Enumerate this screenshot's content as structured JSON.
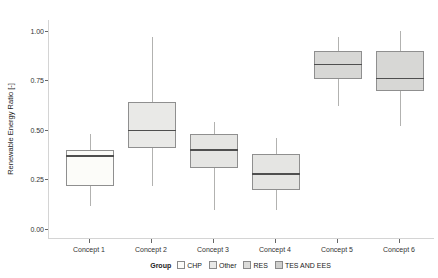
{
  "figure": {
    "background": "#ffffff"
  },
  "chart_data": {
    "type": "boxplot",
    "title": "",
    "xlabel": "",
    "ylabel": "Renewable Energy Ratio [-]",
    "ylim": [
      0,
      1.0
    ],
    "grid": "off",
    "yticks": [
      "0.00",
      "0.25",
      "0.50",
      "0.75",
      "1.00"
    ],
    "ytick_values": [
      0,
      0.25,
      0.5,
      0.75,
      1.0
    ],
    "categories": [
      "Concept 1",
      "Concept 2",
      "Concept 3",
      "Concept 4",
      "Concept 5",
      "Concept 6"
    ],
    "series": [
      {
        "category": "Concept 1",
        "whisker_low": 0.12,
        "q1": 0.22,
        "median": 0.37,
        "q3": 0.4,
        "whisker_high": 0.48,
        "fill": "#fcfcf9"
      },
      {
        "category": "Concept 2",
        "whisker_low": 0.22,
        "q1": 0.41,
        "median": 0.5,
        "q3": 0.64,
        "whisker_high": 0.97,
        "fill": "#e9e9e7"
      },
      {
        "category": "Concept 3",
        "whisker_low": 0.1,
        "q1": 0.31,
        "median": 0.4,
        "q3": 0.48,
        "whisker_high": 0.54,
        "fill": "#e5e5e3"
      },
      {
        "category": "Concept 4",
        "whisker_low": 0.1,
        "q1": 0.2,
        "median": 0.28,
        "q3": 0.38,
        "whisker_high": 0.46,
        "fill": "#e5e5e3"
      },
      {
        "category": "Concept 5",
        "whisker_low": 0.62,
        "q1": 0.76,
        "median": 0.83,
        "q3": 0.9,
        "whisker_high": 0.97,
        "fill": "#d7d7d5"
      },
      {
        "category": "Concept 6",
        "whisker_low": 0.52,
        "q1": 0.7,
        "median": 0.76,
        "q3": 0.9,
        "whisker_high": 1.0,
        "fill": "#d7d7d5"
      }
    ],
    "legend": {
      "title": "Group",
      "position": "bottom",
      "entries": [
        {
          "label": "CHP",
          "fill": "#fcfcf9"
        },
        {
          "label": "Other",
          "fill": "#e9e9e7"
        },
        {
          "label": "RES",
          "fill": "#dcdcda"
        },
        {
          "label": "TES AND EES",
          "fill": "#cfcfcd"
        }
      ]
    },
    "style": {
      "box_border": "#8f8f8f",
      "median_color": "#4f4f4f",
      "whisker_color": "#b2b2b0",
      "axis_line": "#d4d4d4",
      "tick_color": "#666666",
      "text_color": "#333333"
    }
  }
}
